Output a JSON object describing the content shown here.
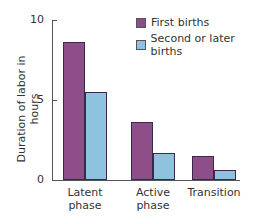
{
  "chart_data": {
    "type": "bar",
    "title": "",
    "xlabel": "",
    "ylabel": "Duration of labor in hours",
    "ylim": [
      0,
      10
    ],
    "yticks": [
      0,
      5,
      10
    ],
    "categories": [
      "Latent phase",
      "Active phase",
      "Transition"
    ],
    "category_lines": [
      [
        "Latent",
        "phase"
      ],
      [
        "Active",
        "phase"
      ],
      [
        "Transition",
        ""
      ]
    ],
    "series": [
      {
        "name": "First births",
        "color": "#8e4e8a",
        "values": [
          8.6,
          3.6,
          1.5
        ]
      },
      {
        "name": "Second or later births",
        "color": "#8ec2de",
        "values": [
          5.5,
          1.7,
          0.6
        ]
      }
    ],
    "legend_position": "top-right",
    "grid": false
  }
}
